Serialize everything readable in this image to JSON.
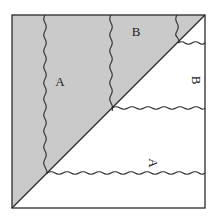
{
  "diagram": {
    "labels": {
      "top_b": "B",
      "left_a": "A",
      "right_b": "B",
      "bottom_a": "A"
    },
    "colors": {
      "shaded_fill": "#cacaca",
      "line": "#2a2a2a",
      "background": "#ffffff"
    },
    "square": {
      "x": 12,
      "y": 15,
      "size": 193
    },
    "regions": {
      "upper_triangle": "shaded",
      "lower_triangle": "unshaded"
    }
  }
}
